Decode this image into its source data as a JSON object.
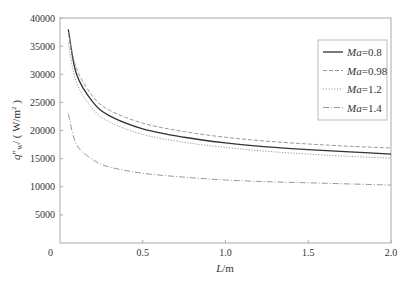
{
  "chart_data": {
    "type": "line",
    "title": "",
    "xlabel": "L/m",
    "ylabel": "q\"w/(W/m²)",
    "xlim": [
      0,
      2.0
    ],
    "ylim": [
      0,
      40000
    ],
    "xticks": [
      "0",
      "0.5",
      "1.0",
      "1.5",
      "2.0"
    ],
    "yticks": [
      "0",
      "5000",
      "10000",
      "15000",
      "20000",
      "25000",
      "30000",
      "35000",
      "40000"
    ],
    "grid": false,
    "legend_position": "upper right",
    "x": [
      0.05,
      0.1,
      0.2,
      0.3,
      0.5,
      0.75,
      1.0,
      1.25,
      1.5,
      1.75,
      2.0
    ],
    "series": [
      {
        "name": "Ma=0.8",
        "style": "solid",
        "color": "#333333",
        "values": [
          38000,
          30000,
          25000,
          22600,
          20300,
          18800,
          17800,
          17100,
          16600,
          16200,
          15800
        ]
      },
      {
        "name": "Ma=0.98",
        "style": "dashed",
        "color": "#999999",
        "values": [
          37500,
          31000,
          26000,
          23600,
          21300,
          19800,
          18800,
          18100,
          17600,
          17200,
          16900
        ]
      },
      {
        "name": "Ma=1.2",
        "style": "dotted",
        "color": "#999999",
        "values": [
          35500,
          28500,
          23800,
          21500,
          19300,
          17900,
          17000,
          16300,
          15800,
          15400,
          15100
        ]
      },
      {
        "name": "Ma=1.4",
        "style": "dashdot",
        "color": "#999999",
        "values": [
          23000,
          17500,
          14800,
          13500,
          12400,
          11700,
          11200,
          10900,
          10700,
          10500,
          10300
        ]
      }
    ]
  }
}
